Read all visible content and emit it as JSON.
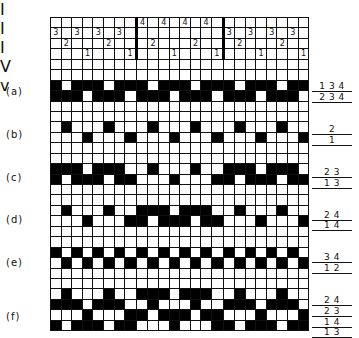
{
  "threading": {
    "rows": 4,
    "columns": [
      3,
      2,
      3,
      1,
      3,
      2,
      3,
      1,
      4,
      2,
      4,
      1,
      4,
      2,
      4,
      1,
      3,
      2,
      3,
      1,
      3,
      2,
      3,
      1
    ],
    "section_dividers_after": [
      8,
      16
    ]
  },
  "patterns": [
    {
      "label": "(a)",
      "lifts": [
        "134",
        "234"
      ]
    },
    {
      "label": "(b)",
      "lifts": [
        "2",
        "1"
      ]
    },
    {
      "label": "(c)",
      "lifts": [
        "23",
        "13"
      ]
    },
    {
      "label": "(d)",
      "lifts": [
        "24",
        "14"
      ]
    },
    {
      "label": "(e)",
      "lifts": [
        "34",
        "12"
      ]
    },
    {
      "label": "(f)",
      "lifts": [
        "24",
        "23",
        "14",
        "13"
      ]
    }
  ],
  "cut_text": [
    "I",
    "I",
    "I",
    "V",
    "v"
  ],
  "colors": {
    "ink": "#111111",
    "paper": "#ffffff"
  }
}
